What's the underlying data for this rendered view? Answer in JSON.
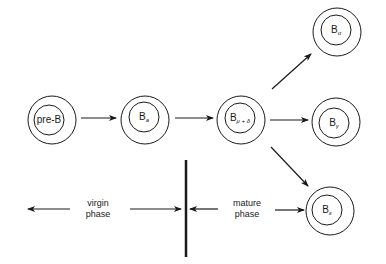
{
  "colors": {
    "stroke": "#1a1a1a",
    "background": "#ffffff"
  },
  "cells": [
    {
      "id": "pre-b",
      "label": "pre-B",
      "sub": "",
      "cx": 52,
      "cy": 120,
      "icx": 49,
      "icy": 120
    },
    {
      "id": "b-s",
      "label": "B",
      "sub": "a",
      "cx": 145,
      "cy": 120,
      "icx": 144,
      "icy": 117
    },
    {
      "id": "b-mu-delta",
      "label": "B",
      "sub": "μ + δ",
      "cx": 241,
      "cy": 120,
      "icx": 240,
      "icy": 118
    },
    {
      "id": "b-alpha",
      "label": "B",
      "sub": "α",
      "cx": 337,
      "cy": 32,
      "icx": 336,
      "icy": 30
    },
    {
      "id": "b-gamma",
      "label": "B",
      "sub": "γ",
      "cx": 336,
      "cy": 122,
      "icx": 334,
      "icy": 123
    },
    {
      "id": "b-epsilon",
      "label": "B",
      "sub": "ε",
      "cx": 330,
      "cy": 211,
      "icx": 327,
      "icy": 210
    }
  ],
  "arrows": [
    {
      "id": "pre-b-to-b-s",
      "x1": 81,
      "y1": 118,
      "x2": 116,
      "y2": 118
    },
    {
      "id": "b-s-to-b-mu-delta",
      "x1": 175,
      "y1": 118,
      "x2": 213,
      "y2": 118
    },
    {
      "id": "b-mu-delta-to-b-gamma",
      "x1": 270,
      "y1": 120,
      "x2": 308,
      "y2": 120
    },
    {
      "id": "b-mu-delta-to-b-alpha",
      "x1": 272,
      "y1": 89,
      "x2": 311,
      "y2": 54
    },
    {
      "id": "b-mu-delta-to-b-epsilon",
      "x1": 271,
      "y1": 147,
      "x2": 308,
      "y2": 186
    },
    {
      "id": "virgin-left",
      "x1": 70,
      "y1": 209,
      "x2": 28,
      "y2": 209
    },
    {
      "id": "virgin-right",
      "x1": 130,
      "y1": 209,
      "x2": 181,
      "y2": 209
    },
    {
      "id": "mature-left",
      "x1": 218,
      "y1": 209,
      "x2": 190,
      "y2": 209
    },
    {
      "id": "mature-right",
      "x1": 275,
      "y1": 210,
      "x2": 304,
      "y2": 210
    }
  ],
  "divider": {
    "x": 186,
    "y1": 160,
    "y2": 257
  },
  "phases": {
    "virgin": {
      "line1": "virgin",
      "line2": "phase",
      "cx": 98,
      "cy": 209
    },
    "mature": {
      "line1": "mature",
      "line2": "phase",
      "cx": 247,
      "cy": 209
    }
  }
}
